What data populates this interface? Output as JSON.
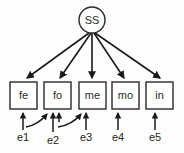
{
  "diagram": {
    "type": "sem-path-diagram",
    "title": "",
    "background_color": "#fdfdfd",
    "stroke_color": "#1a1a1a",
    "node_fill": "#ffffff",
    "latent": {
      "id": "SS",
      "label": "SS",
      "shape": "circle",
      "cx": 92,
      "cy": 20,
      "r": 13
    },
    "indicators": [
      {
        "id": "fe",
        "label": "fe",
        "x": 10,
        "y": 82,
        "w": 27,
        "h": 27
      },
      {
        "id": "fo",
        "label": "fo",
        "x": 44,
        "y": 82,
        "w": 27,
        "h": 27
      },
      {
        "id": "me",
        "label": "me",
        "x": 79,
        "y": 82,
        "w": 27,
        "h": 27
      },
      {
        "id": "mo",
        "label": "mo",
        "x": 112,
        "y": 82,
        "w": 27,
        "h": 27
      },
      {
        "id": "in",
        "label": "in",
        "x": 146,
        "y": 82,
        "w": 27,
        "h": 27
      }
    ],
    "errors": [
      {
        "id": "e1",
        "label": "e1",
        "x": 23,
        "y": 136,
        "target": "fe"
      },
      {
        "id": "e2",
        "label": "e2",
        "x": 53,
        "y": 139,
        "target": "fo"
      },
      {
        "id": "e3",
        "label": "e3",
        "x": 86,
        "y": 136,
        "target": "me"
      },
      {
        "id": "e4",
        "label": "e4",
        "x": 118,
        "y": 136,
        "target": "mo"
      },
      {
        "id": "e5",
        "label": "e5",
        "x": 155,
        "y": 136,
        "target": "in"
      }
    ],
    "factor_loadings": [
      {
        "from": "SS",
        "to": "fe"
      },
      {
        "from": "SS",
        "to": "fo"
      },
      {
        "from": "SS",
        "to": "me"
      },
      {
        "from": "SS",
        "to": "mo"
      },
      {
        "from": "SS",
        "to": "in"
      }
    ],
    "cross_paths": [
      {
        "from": "e1",
        "to": "fo"
      },
      {
        "from": "e2",
        "to": "me"
      }
    ]
  }
}
